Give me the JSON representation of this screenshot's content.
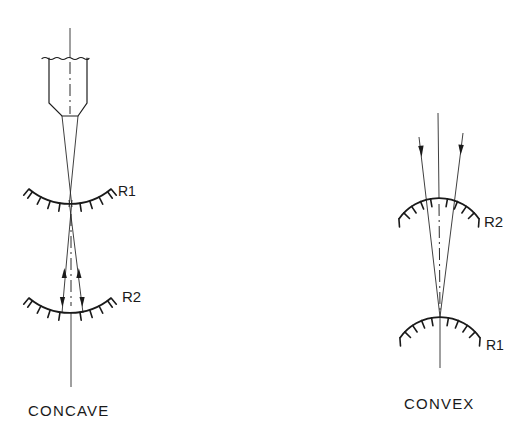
{
  "diagram": {
    "concave": {
      "caption": "CONCAVE",
      "labels": {
        "r1": "R1",
        "r2": "R2"
      }
    },
    "convex": {
      "caption": "CONVEX",
      "labels": {
        "r2": "R2",
        "r1": "R1"
      }
    }
  }
}
